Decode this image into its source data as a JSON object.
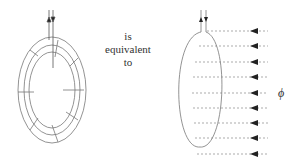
{
  "diagram": {
    "left_figure": "toroid-with-wire-turns",
    "right_figure": "single-loop-with-flux",
    "middle_text_lines": [
      "is",
      "equivalent",
      "to"
    ],
    "flux_symbol": "ϕ",
    "flux_arrow_count": 9,
    "colors": {
      "line": "#666666",
      "text": "#333333",
      "background": "#ffffff"
    }
  }
}
